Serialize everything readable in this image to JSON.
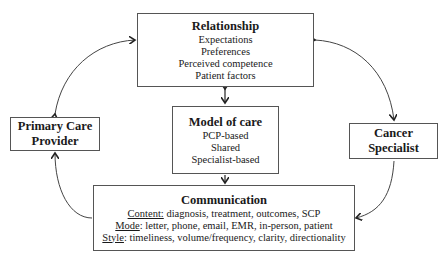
{
  "diagram": {
    "relationship": {
      "title": "Relationship",
      "items": [
        "Expectations",
        "Preferences",
        "Perceived competence",
        "Patient factors"
      ]
    },
    "model_of_care": {
      "title": "Model of care",
      "items": [
        "PCP-based",
        "Shared",
        "Specialist-based"
      ]
    },
    "communication": {
      "title": "Communication",
      "rows": [
        {
          "label": "Content:",
          "text": " diagnosis, treatment, outcomes, SCP"
        },
        {
          "label": "Mode",
          "text": ": letter, phone, email, EMR, in-person, patient"
        },
        {
          "label": "Style",
          "text": ": timeliness, volume/frequency, clarity, directionality"
        }
      ]
    },
    "primary_care": {
      "line1": "Primary Care",
      "line2": "Provider"
    },
    "cancer_specialist": {
      "line1": "Cancer",
      "line2": "Specialist"
    }
  }
}
